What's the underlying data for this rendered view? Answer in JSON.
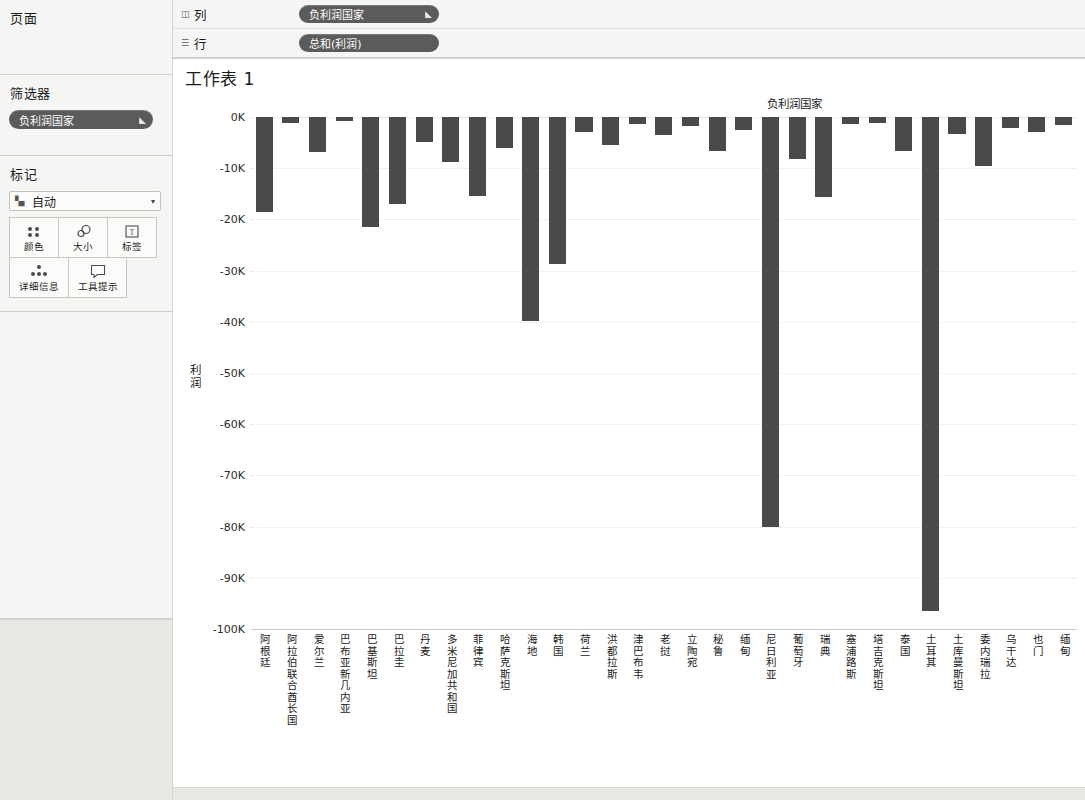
{
  "left_panel": {
    "pages": {
      "title": "页面"
    },
    "filters": {
      "title": "筛选器",
      "pills": [
        {
          "label": "负利润国家",
          "icon": "filter-pill-icon"
        }
      ]
    },
    "marks": {
      "title": "标记",
      "mark_type": {
        "label": "自动",
        "icon": "bar-mark-icon",
        "caret": "▾"
      },
      "buttons": [
        {
          "label": "颜色",
          "icon": "color-dots-icon"
        },
        {
          "label": "大小",
          "icon": "size-icon"
        },
        {
          "label": "标签",
          "icon": "label-icon"
        },
        {
          "label": "详细信息",
          "icon": "detail-icon"
        },
        {
          "label": "工具提示",
          "icon": "tooltip-icon"
        }
      ]
    }
  },
  "shelves": [
    {
      "name": "列",
      "icon": "columns-icon",
      "pill": {
        "label": "负利润国家",
        "icon": "pill-menu-icon"
      }
    },
    {
      "name": "行",
      "icon": "rows-icon",
      "pill": {
        "label": "总和(利润)",
        "icon": ""
      }
    }
  ],
  "worksheet": {
    "title": "工作表 1",
    "column_header": "负利润国家"
  },
  "colors": {
    "bar": "#4a4a4a",
    "pill": "#5b5b5b",
    "panel": "#f5f5f3",
    "grid": "#e2e2e0"
  },
  "chart_data": {
    "type": "bar",
    "title": "工作表 1",
    "subtitle": "负利润国家",
    "xlabel": "负利润国家",
    "ylabel": "利润",
    "ylim": [
      -100000,
      0
    ],
    "ytick_labels": [
      "0K",
      "-10K",
      "-20K",
      "-30K",
      "-40K",
      "-50K",
      "-60K",
      "-70K",
      "-80K",
      "-90K",
      "-100K"
    ],
    "ytick_values": [
      0,
      -10000,
      -20000,
      -30000,
      -40000,
      -50000,
      -60000,
      -70000,
      -80000,
      -90000,
      -100000
    ],
    "grid": true,
    "legend": "none",
    "orientation": "vertical",
    "categories": [
      "阿根廷",
      "阿拉伯联合酋长国",
      "爱尔兰",
      "巴布亚新几内亚",
      "巴基斯坦",
      "巴拉圭",
      "丹麦",
      "多米尼加共和国",
      "菲律宾",
      "哈萨克斯坦",
      "海地",
      "韩国",
      "荷兰",
      "洪都拉斯",
      "津巴布韦",
      "老挝",
      "立陶宛",
      "秘鲁",
      "缅甸",
      "尼日利亚",
      "葡萄牙",
      "瑞典",
      "塞浦路斯",
      "塔吉克斯坦",
      "泰国",
      "土耳其",
      "土库曼斯坦",
      "委内瑞拉",
      "乌干达",
      "也门",
      "缅甸"
    ],
    "values": [
      -18500,
      -1200,
      -6800,
      -800,
      -21500,
      -17000,
      -4800,
      -8700,
      -15500,
      -6000,
      -39800,
      -28800,
      -2900,
      -5400,
      -1300,
      -3500,
      -1800,
      -6700,
      -2600,
      -80000,
      -8300,
      -15600,
      -1300,
      -1200,
      -6700,
      -96500,
      -3400,
      -9500,
      -2200,
      -2900,
      -1500
    ],
    "series_name": "总和(利润)"
  }
}
